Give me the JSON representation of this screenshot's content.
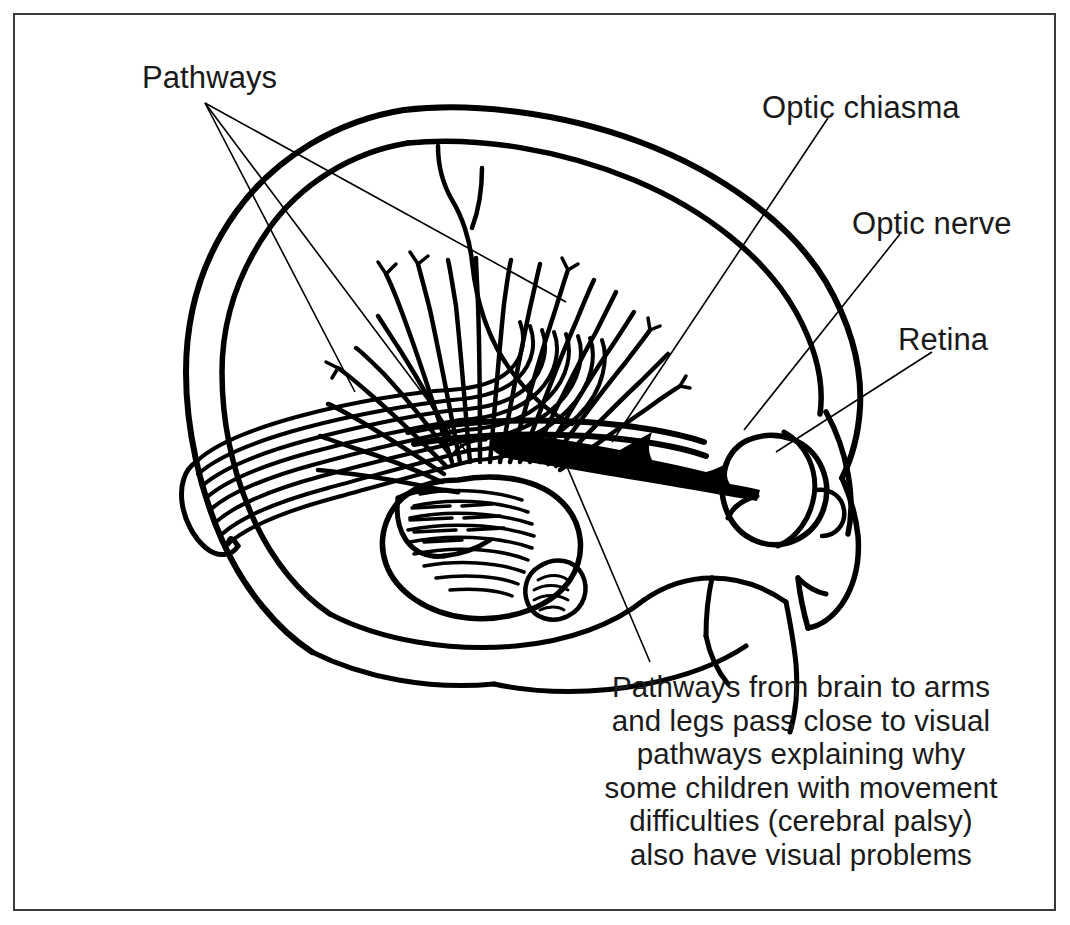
{
  "figure": {
    "background_color": "#ffffff",
    "ink_color": "#000000",
    "frame_color": "#3a3a3a",
    "width": 1070,
    "height": 925
  },
  "labels": {
    "pathways": "Pathways",
    "optic_chiasma": "Optic chiasma",
    "optic_nerve": "Optic nerve",
    "retina": "Retina"
  },
  "caption": {
    "lines": [
      "Pathways from brain to arms",
      "and legs pass close to visual",
      "pathways explaining why",
      "some children with movement",
      "difficulties (cerebral palsy)",
      "also have visual problems"
    ]
  },
  "anatomy": {
    "parts": [
      "skull-outline",
      "brain-outline",
      "central-sulcus",
      "corona-radiata-fibers",
      "optic-radiation-bundle",
      "occipital-pole",
      "brainstem",
      "cerebellum",
      "optic-tract-arrow",
      "optic-chiasm",
      "optic-nerve",
      "eyeball",
      "retina",
      "face-profile",
      "nose"
    ]
  },
  "leaders": {
    "pathways_origin": {
      "x": 205,
      "y": 103
    },
    "pathways_targets": [
      {
        "x": 355,
        "y": 388
      },
      {
        "x": 470,
        "y": 455
      },
      {
        "x": 560,
        "y": 300
      }
    ],
    "optic_chiasma": {
      "from": {
        "x": 828,
        "y": 118
      },
      "to": {
        "x": 612,
        "y": 440
      }
    },
    "optic_nerve": {
      "from": {
        "x": 900,
        "y": 232
      },
      "to": {
        "x": 745,
        "y": 428
      }
    },
    "retina": {
      "from": {
        "x": 930,
        "y": 352
      },
      "to": {
        "x": 778,
        "y": 452
      }
    },
    "caption": {
      "from": {
        "x": 648,
        "y": 660
      },
      "to": {
        "x": 555,
        "y": 438
      }
    }
  }
}
